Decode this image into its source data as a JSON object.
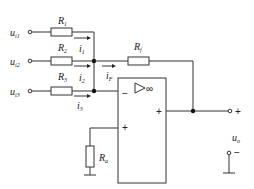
{
  "diagram": {
    "type": "inverting summing amplifier",
    "inputs": [
      {
        "label": "u",
        "sub": "i1"
      },
      {
        "label": "u",
        "sub": "i2"
      },
      {
        "label": "u",
        "sub": "i3"
      }
    ],
    "resistors": {
      "r1": {
        "label": "R",
        "sub": "1"
      },
      "r2": {
        "label": "R",
        "sub": "2"
      },
      "r3": {
        "label": "R",
        "sub": "3"
      },
      "rf": {
        "label": "R",
        "sub": "f"
      },
      "ra": {
        "label": "R",
        "sub": "a"
      }
    },
    "currents": {
      "i1": {
        "label": "i",
        "sub": "1"
      },
      "i2": {
        "label": "i",
        "sub": "2"
      },
      "i3": {
        "label": "i",
        "sub": "3"
      },
      "if": {
        "label": "i",
        "sub": "F"
      }
    },
    "opamp": {
      "symbol": "▷∞",
      "inverting": "−",
      "noninverting": "+",
      "output": "+"
    },
    "output": {
      "label": "u",
      "sub": "o",
      "plus": "+",
      "minus": "−"
    }
  }
}
